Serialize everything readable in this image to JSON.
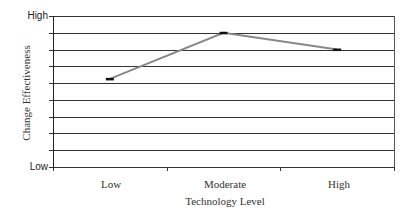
{
  "chart_data": {
    "type": "line",
    "title": "",
    "xlabel": "Technology Level",
    "ylabel": "Change Effectiveness",
    "categories": [
      "Low",
      "Moderate",
      "High"
    ],
    "series": [
      {
        "name": "Change Effectiveness",
        "values": [
          5.25,
          8,
          7
        ],
        "color": "#888888"
      }
    ],
    "y_tick_labels": {
      "top": "High",
      "bottom": "Low"
    },
    "ylim": [
      0,
      9
    ],
    "grid": true,
    "gridline_count": 10,
    "legend": "none"
  },
  "labels": {
    "y_high": "High",
    "y_low": "Low",
    "x_low": "Low",
    "x_moderate": "Moderate",
    "x_high": "High",
    "x_title": "Technology Level",
    "y_title": "Change Effectiveness"
  }
}
